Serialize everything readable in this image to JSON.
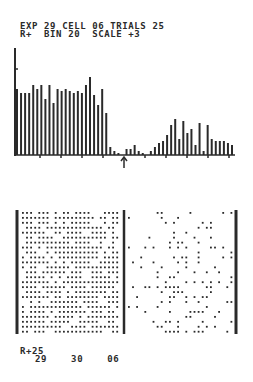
{
  "header": {
    "line1": "EXP 29 CELL 06 TRIALS 25",
    "line2": "R+  BIN 20  SCALE +3",
    "exp": "29",
    "cell": "06",
    "trials": "25",
    "condition": "R+",
    "bin": "20",
    "scale": "+3"
  },
  "footer": {
    "line1": "R+25",
    "line2": "29    30    06"
  },
  "colors": {
    "ink": "#2a2a2a",
    "background": "#ffffff"
  },
  "chart_data": [
    {
      "type": "bar",
      "title": "Peri-stimulus time histogram",
      "xlabel": "",
      "ylabel": "",
      "stimulus_marker": "arrow at bin 27",
      "y_ticks": 4,
      "grid": false,
      "values": [
        66,
        62,
        62,
        62,
        70,
        66,
        70,
        56,
        70,
        52,
        66,
        64,
        66,
        64,
        62,
        64,
        62,
        70,
        78,
        60,
        50,
        66,
        42,
        8,
        4,
        2,
        0,
        6,
        6,
        10,
        4,
        2,
        0,
        4,
        8,
        12,
        14,
        20,
        30,
        36,
        16,
        34,
        22,
        26,
        10,
        32,
        4,
        30,
        16,
        14,
        14,
        14,
        12,
        10
      ]
    },
    {
      "type": "scatter",
      "title": "Spike raster",
      "rows": 25,
      "divider": "stimulus onset between left (pre) and right (post) panels",
      "pre_density": "high",
      "post_density": "sparse"
    }
  ]
}
